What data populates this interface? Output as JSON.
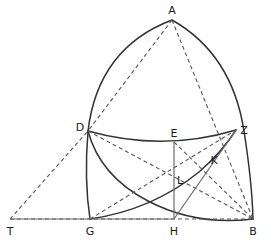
{
  "figure": {
    "background_color": "#ffffff",
    "stroke_color": "#333333",
    "thin_stroke_color": "#6b6b6b",
    "label_color": "#1b1b1b"
  },
  "points": {
    "A": {
      "label": "A",
      "x": 172,
      "y": 20,
      "label_x": 172,
      "label_y": 11
    },
    "D": {
      "label": "D",
      "x": 88,
      "y": 131,
      "label_x": 81,
      "label_y": 128
    },
    "E": {
      "label": "E",
      "x": 174,
      "y": 142,
      "label_x": 174,
      "label_y": 134
    },
    "Z": {
      "label": "Z",
      "x": 236,
      "y": 130,
      "label_x": 243,
      "label_y": 131
    },
    "K": {
      "label": "K",
      "x": 206,
      "y": 163,
      "label_x": 213,
      "label_y": 160
    },
    "L": {
      "label": "L",
      "x": 174,
      "y": 175,
      "label_x": 180,
      "label_y": 180
    },
    "T": {
      "label": "T",
      "x": 10,
      "y": 219,
      "label_x": 9,
      "label_y": 232
    },
    "G": {
      "label": "G",
      "x": 90,
      "y": 219,
      "label_x": 90,
      "label_y": 232
    },
    "H": {
      "label": "H",
      "x": 174,
      "y": 219,
      "label_x": 174,
      "label_y": 232
    },
    "B": {
      "label": "B",
      "x": 253,
      "y": 219,
      "label_x": 253,
      "label_y": 232
    }
  },
  "arcs": {
    "A_to_G_outer": "M 172 20 Q 98 48 88 131 Q 84 180 90 219",
    "A_to_B_outer": "M 172 20 Q 232 54 244 131 Q 252 182 253 219",
    "D_to_Z_chord": "M 88 131 Q 163 152 236 130",
    "G_to_Z_arc": "M 90 219 Q 152 210 199 172 Q 222 152 236 130",
    "D_to_B_arc": "M 88 131 Q 100 176 148 201 Q 196 226 253 219"
  },
  "solid_lines": [
    {
      "name": "baseline-T-H",
      "x1": 10,
      "y1": 219,
      "x2": 174,
      "y2": 219
    },
    {
      "name": "vertical-E-H",
      "x1": 174,
      "y1": 142,
      "x2": 174,
      "y2": 219
    },
    {
      "name": "line-H-Z",
      "x1": 174,
      "y1": 219,
      "x2": 236,
      "y2": 130
    }
  ],
  "dashed_lines": [
    {
      "name": "chord-A-D",
      "x1": 172,
      "y1": 20,
      "x2": 88,
      "y2": 131
    },
    {
      "name": "chord-A-B",
      "x1": 172,
      "y1": 20,
      "x2": 253,
      "y2": 219
    },
    {
      "name": "line-T-D",
      "x1": 10,
      "y1": 219,
      "x2": 88,
      "y2": 131
    },
    {
      "name": "line-T-B",
      "x1": 10,
      "y1": 219,
      "x2": 253,
      "y2": 219
    },
    {
      "name": "line-D-B",
      "x1": 88,
      "y1": 131,
      "x2": 253,
      "y2": 219
    },
    {
      "name": "line-G-Z",
      "x1": 90,
      "y1": 219,
      "x2": 236,
      "y2": 130
    },
    {
      "name": "line-E-B",
      "x1": 174,
      "y1": 142,
      "x2": 253,
      "y2": 219
    },
    {
      "name": "line-D-E-Z-ray",
      "x1": 88,
      "y1": 131,
      "x2": 236,
      "y2": 130
    }
  ]
}
